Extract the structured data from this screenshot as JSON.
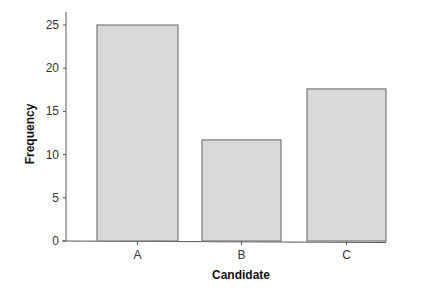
{
  "chart_data": {
    "type": "bar",
    "title": "",
    "xlabel": "Candidate",
    "ylabel": "Frequency",
    "categories": [
      "A",
      "B",
      "C"
    ],
    "values": [
      25,
      11.7,
      17.6
    ],
    "ylim": [
      0,
      25
    ],
    "yticks": [
      0,
      5,
      10,
      15,
      20,
      25
    ],
    "grid": false,
    "legend": null,
    "bar_color": "#d9d9d9",
    "bar_edge_color": "#7a7a7a"
  }
}
